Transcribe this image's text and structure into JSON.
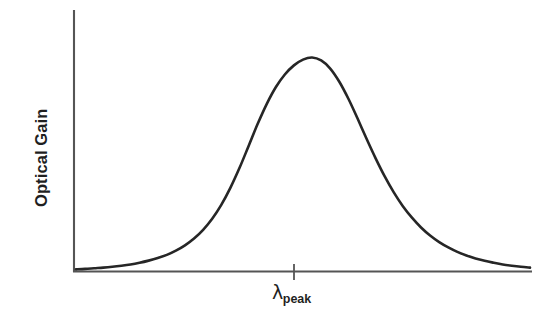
{
  "chart_data": {
    "type": "line",
    "title": "",
    "subtitle": "",
    "xlabel": "λ_peak",
    "xlabel_symbol": "λ",
    "xlabel_subscript": "peak",
    "ylabel": "Optical Gain",
    "grid": false,
    "legend": null,
    "xlim": [
      0,
      100
    ],
    "ylim": [
      0,
      1.08
    ],
    "axis_ticks_x": [
      {
        "value": 50,
        "label": "λ_peak"
      }
    ],
    "axis_ticks_y": [],
    "annotations": [],
    "series": [
      {
        "name": "Optical Gain spectrum",
        "description": "Asymmetric resonance peak centered at lambda_peak",
        "x": [
          0,
          2,
          4,
          6,
          8,
          10,
          12,
          14,
          16,
          18,
          20,
          22,
          24,
          26,
          28,
          30,
          32,
          34,
          36,
          38,
          40,
          42,
          44,
          46,
          48,
          50,
          52,
          54,
          56,
          58,
          60,
          62,
          64,
          66,
          68,
          70,
          72,
          74,
          76,
          78,
          80,
          82,
          84,
          86,
          88,
          90,
          92,
          94,
          96,
          98,
          100
        ],
        "y": [
          0.004,
          0.006,
          0.009,
          0.012,
          0.016,
          0.021,
          0.027,
          0.035,
          0.045,
          0.057,
          0.072,
          0.092,
          0.117,
          0.149,
          0.19,
          0.242,
          0.307,
          0.387,
          0.48,
          0.583,
          0.687,
          0.781,
          0.86,
          0.92,
          0.963,
          0.99,
          1.0,
          0.986,
          0.948,
          0.886,
          0.806,
          0.714,
          0.618,
          0.526,
          0.441,
          0.366,
          0.301,
          0.247,
          0.201,
          0.163,
          0.132,
          0.107,
          0.086,
          0.069,
          0.055,
          0.044,
          0.035,
          0.027,
          0.021,
          0.016,
          0.012
        ]
      }
    ],
    "colors": {
      "curve": "#262626",
      "axis": "#555555",
      "background": "#ffffff",
      "text": "#1f1f1f"
    }
  },
  "figure": {
    "y_axis_label": "Optical Gain",
    "x_tick_symbol": "λ",
    "x_tick_subscript": "peak"
  }
}
